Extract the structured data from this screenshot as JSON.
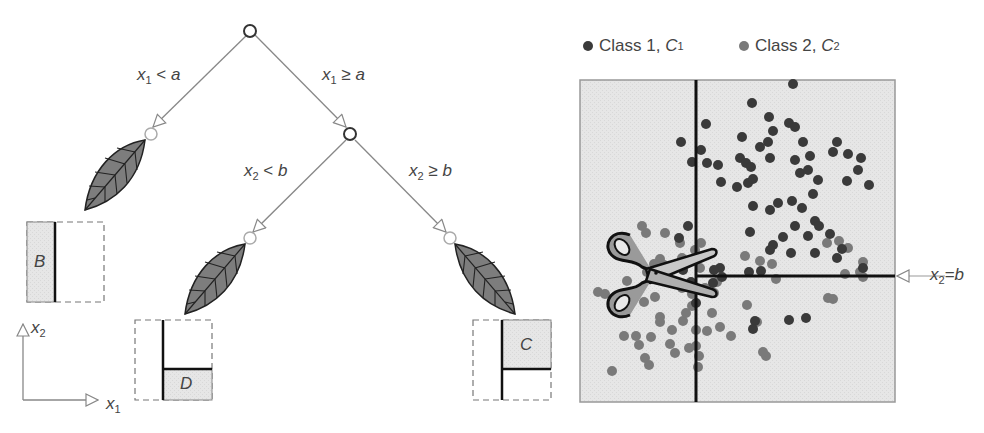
{
  "tree": {
    "root": {
      "condition_left": "x₁ < a",
      "condition_right": "x₁ ≥ a"
    },
    "labels": {
      "x1_lt_a": {
        "var": "x",
        "sub": "1",
        "op": "<",
        "rhs": "a"
      },
      "x1_ge_a": {
        "var": "x",
        "sub": "1",
        "op": "≥",
        "rhs": "a"
      },
      "x2_lt_b": {
        "var": "x",
        "sub": "2",
        "op": "<",
        "rhs": "b"
      },
      "x2_ge_b": {
        "var": "x",
        "sub": "2",
        "op": "≥",
        "rhs": "b"
      }
    },
    "leaves": [
      {
        "region": "B",
        "description": "left of x1=a"
      },
      {
        "region": "D",
        "description": "x1>=a and x2<b"
      },
      {
        "region": "C",
        "description": "x1>=a and x2>=b"
      }
    ]
  },
  "axes": {
    "x_var": "x",
    "x_sub": "1",
    "y_var": "x",
    "y_sub": "2"
  },
  "legend": {
    "class1": {
      "label": "Class 1, ",
      "sym": "C",
      "sub": "1",
      "color": "#3a3a3a"
    },
    "class2": {
      "label": "Class 2, ",
      "sym": "C",
      "sub": "2",
      "color": "#7a7a7a"
    }
  },
  "plot": {
    "split_label": {
      "var": "x",
      "sub": "2",
      "op": "=",
      "rhs": "b"
    },
    "background": "#e8e8e8"
  },
  "chart_data": {
    "type": "scatter",
    "title": "",
    "legend": [
      "Class 1, C1",
      "Class 2, C2"
    ],
    "xlabel": "x1",
    "ylabel": "x2",
    "annotations": [
      "x2 = b",
      "vertical split x1 = a",
      "scissors icon at split"
    ],
    "series": [
      {
        "name": "Class 1, C1",
        "color": "#3a3a3a",
        "points": [
          [
            793,
            84
          ],
          [
            752,
            103
          ],
          [
            706,
            124
          ],
          [
            769,
            117
          ],
          [
            773,
            131
          ],
          [
            768,
            142
          ],
          [
            789,
            123
          ],
          [
            795,
            127
          ],
          [
            742,
            137
          ],
          [
            760,
            147
          ],
          [
            740,
            158
          ],
          [
            770,
            158
          ],
          [
            803,
            142
          ],
          [
            810,
            156
          ],
          [
            795,
            160
          ],
          [
            701,
            150
          ],
          [
            681,
            142
          ],
          [
            692,
            162
          ],
          [
            707,
            163
          ],
          [
            718,
            165
          ],
          [
            746,
            163
          ],
          [
            751,
            167
          ],
          [
            721,
            182
          ],
          [
            737,
            187
          ],
          [
            748,
            183
          ],
          [
            753,
            179
          ],
          [
            800,
            173
          ],
          [
            808,
            170
          ],
          [
            818,
            180
          ],
          [
            837,
            142
          ],
          [
            833,
            152
          ],
          [
            848,
            154
          ],
          [
            861,
            158
          ],
          [
            858,
            170
          ],
          [
            869,
            185
          ],
          [
            847,
            181
          ],
          [
            792,
            201
          ],
          [
            753,
            206
          ],
          [
            770,
            210
          ],
          [
            778,
            203
          ],
          [
            802,
            208
          ],
          [
            813,
            194
          ],
          [
            815,
            221
          ],
          [
            795,
            226
          ],
          [
            808,
            236
          ],
          [
            819,
            226
          ],
          [
            783,
            237
          ],
          [
            773,
            245
          ],
          [
            791,
            253
          ],
          [
            815,
            253
          ],
          [
            750,
            232
          ],
          [
            770,
            250
          ],
          [
            863,
            268
          ],
          [
            842,
            249
          ],
          [
            830,
            234
          ],
          [
            837,
            258
          ],
          [
            749,
            272
          ],
          [
            761,
            271
          ],
          [
            720,
            268
          ],
          [
            714,
            270
          ],
          [
            679,
            238
          ],
          [
            688,
            226
          ],
          [
            722,
            277
          ],
          [
            713,
            283
          ],
          [
            755,
            321
          ],
          [
            789,
            320
          ],
          [
            806,
            318
          ],
          [
            753,
            329
          ],
          [
            683,
            270
          ],
          [
            691,
            282
          ],
          [
            696,
            303
          ]
        ]
      },
      {
        "name": "Class 2, C2",
        "color": "#7a7a7a",
        "points": [
          [
            642,
            226
          ],
          [
            646,
            233
          ],
          [
            665,
            233
          ],
          [
            680,
            243
          ],
          [
            682,
            258
          ],
          [
            695,
            250
          ],
          [
            701,
            243
          ],
          [
            660,
            259
          ],
          [
            654,
            264
          ],
          [
            664,
            265
          ],
          [
            647,
            272
          ],
          [
            700,
            268
          ],
          [
            682,
            288
          ],
          [
            692,
            294
          ],
          [
            705,
            288
          ],
          [
            717,
            282
          ],
          [
            714,
            293
          ],
          [
            745,
            256
          ],
          [
            760,
            261
          ],
          [
            772,
            264
          ],
          [
            827,
            243
          ],
          [
            839,
            241
          ],
          [
            848,
            248
          ],
          [
            863,
            262
          ],
          [
            776,
            279
          ],
          [
            828,
            298
          ],
          [
            833,
            299
          ],
          [
            845,
            274
          ],
          [
            860,
            272
          ],
          [
            863,
            277
          ],
          [
            605,
            294
          ],
          [
            624,
            308
          ],
          [
            644,
            302
          ],
          [
            655,
            297
          ],
          [
            660,
            317
          ],
          [
            660,
            322
          ],
          [
            672,
            330
          ],
          [
            683,
            321
          ],
          [
            686,
            313
          ],
          [
            692,
            306
          ],
          [
            696,
            330
          ],
          [
            707,
            331
          ],
          [
            720,
            327
          ],
          [
            731,
            336
          ],
          [
            747,
            305
          ],
          [
            757,
            322
          ],
          [
            766,
            356
          ],
          [
            763,
            352
          ],
          [
            624,
            336
          ],
          [
            636,
            336
          ],
          [
            651,
            337
          ],
          [
            696,
            346
          ],
          [
            699,
            356
          ],
          [
            698,
            367
          ],
          [
            612,
            371
          ],
          [
            645,
            358
          ],
          [
            649,
            365
          ],
          [
            627,
            281
          ],
          [
            598,
            292
          ],
          [
            639,
            345
          ],
          [
            670,
            344
          ],
          [
            675,
            353
          ],
          [
            689,
            348
          ],
          [
            712,
            313
          ]
        ]
      }
    ],
    "xlim": [
      580,
      895
    ],
    "ylim": [
      80,
      402
    ],
    "grid": false
  }
}
